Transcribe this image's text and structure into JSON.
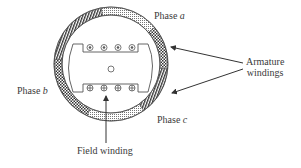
{
  "diagram": {
    "type": "synchronous-machine-cross-section",
    "labels": {
      "phase_a": {
        "prefix": "Phase",
        "var": "a"
      },
      "phase_b": {
        "prefix": "Phase",
        "var": "b"
      },
      "phase_c": {
        "prefix": "Phase",
        "var": "c"
      },
      "armature_line1": "Armature",
      "armature_line2": "windings",
      "field_winding": "Field winding"
    },
    "rotor": {
      "top_conductors": [
        "dot",
        "dot",
        "dot",
        "dot"
      ],
      "bottom_conductors": [
        "cross",
        "cross",
        "cross",
        "cross"
      ]
    },
    "colors": {
      "line": "#4a4a4a",
      "text": "#3a3a3a",
      "background": "#ffffff"
    }
  }
}
